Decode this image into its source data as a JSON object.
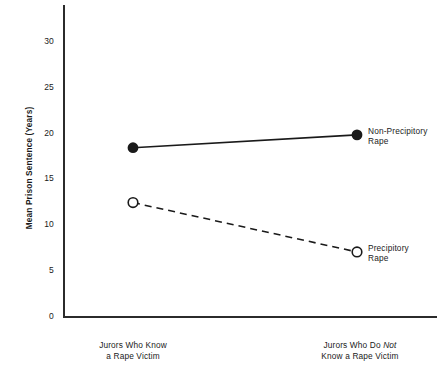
{
  "chart_data": {
    "type": "line",
    "title": "",
    "xlabel": "",
    "ylabel": "Mean Prison Sentence (Years)",
    "categories": [
      "Jurors Who Know a Rape Victim",
      "Jurors Who Do Not Know a Rape Victim"
    ],
    "x_tick_labels": [
      {
        "line1": "Jurors Who Know",
        "line2": "a Rape Victim"
      },
      {
        "line1_pre": "Jurors Who Do ",
        "line1_italic": "Not",
        "line2": "Know a Rape Victim"
      }
    ],
    "y_tick_labels": [
      "0",
      "5",
      "10",
      "15",
      "20",
      "25",
      "30"
    ],
    "y_ticks": [
      0,
      5,
      10,
      15,
      20,
      25,
      30
    ],
    "ylim": [
      0,
      34
    ],
    "grid": false,
    "legend_position": "inline-right",
    "series": [
      {
        "name": "Non-Precipitory Rape",
        "label_line1": "Non-Precipitory",
        "label_line2": "Rape",
        "marker": "filled-circle",
        "linestyle": "solid",
        "color": "#1a1a1a",
        "values": [
          18.4,
          19.8
        ]
      },
      {
        "name": "Precipitory Rape",
        "label_line1": "Precipitory",
        "label_line2": "Rape",
        "marker": "open-circle",
        "linestyle": "dashed",
        "color": "#1a1a1a",
        "values": [
          12.4,
          7.0
        ]
      }
    ]
  },
  "axis": {
    "line_color": "#2b2b2b"
  }
}
